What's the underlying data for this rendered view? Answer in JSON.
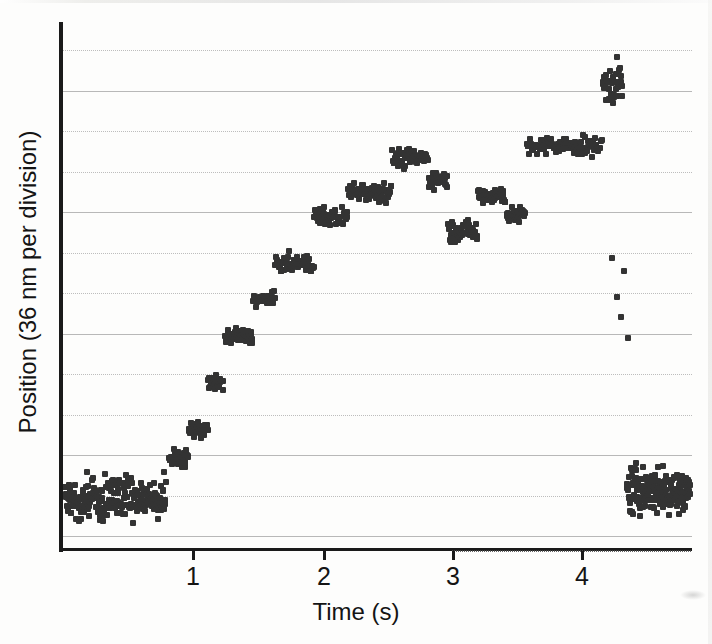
{
  "figure": {
    "title": "",
    "background_color": "#fdfdfc",
    "marker_color": "#333333",
    "axis_color": "#1a1a1a",
    "gridline_color": "#b8b8b8"
  },
  "axes": {
    "x": {
      "label": "Time (s)",
      "ticks": [
        {
          "value": 1,
          "label": "1",
          "px": 192
        },
        {
          "value": 2,
          "label": "2",
          "px": 323
        },
        {
          "value": 3,
          "label": "3",
          "px": 452
        },
        {
          "value": 4,
          "label": "4",
          "px": 581
        }
      ],
      "range": [
        0,
        4.85
      ],
      "origin_px": 62,
      "px_per_unit": 129.7
    },
    "y": {
      "label": "Position (36 nm per division)",
      "division_nm": 36,
      "gridlines_px": [
        50,
        91,
        131,
        172,
        212,
        253,
        293,
        334,
        374,
        415,
        455,
        496,
        536
      ],
      "gridline_styles": [
        "dotted",
        "solid",
        "dotted",
        "dotted",
        "solid",
        "dotted",
        "dotted",
        "solid",
        "dotted",
        "dotted",
        "solid",
        "dotted",
        "solid"
      ],
      "range_px": [
        22,
        550
      ]
    }
  },
  "chart_data": {
    "type": "scatter",
    "title": "",
    "xlabel": "Time (s)",
    "ylabel": "Position (36 nm per division)",
    "xlim": [
      0,
      4.85
    ],
    "ylim": [
      0,
      13
    ],
    "grid": true,
    "legend": null,
    "units": {
      "x": "s",
      "y": "divisions of 36 nm"
    },
    "segments": [
      {
        "name": "baseline-noise-start",
        "t_start": 0.0,
        "t_end": 0.78,
        "level": 1.35,
        "noise": 0.55,
        "n_points": 215
      },
      {
        "name": "step-1",
        "t_start": 0.8,
        "t_end": 0.95,
        "level": 2.35,
        "noise": 0.22,
        "n_points": 32
      },
      {
        "name": "step-2",
        "t_start": 0.95,
        "t_end": 1.1,
        "level": 3.05,
        "noise": 0.2,
        "n_points": 34
      },
      {
        "name": "step-3",
        "t_start": 1.1,
        "t_end": 1.22,
        "level": 4.2,
        "noise": 0.18,
        "n_points": 26
      },
      {
        "name": "step-4",
        "t_start": 1.23,
        "t_end": 1.45,
        "level": 5.35,
        "noise": 0.2,
        "n_points": 40
      },
      {
        "name": "step-5",
        "t_start": 1.45,
        "t_end": 1.62,
        "level": 6.25,
        "noise": 0.18,
        "n_points": 32
      },
      {
        "name": "step-6",
        "t_start": 1.62,
        "t_end": 1.92,
        "level": 7.15,
        "noise": 0.22,
        "n_points": 54
      },
      {
        "name": "step-7",
        "t_start": 1.92,
        "t_end": 2.18,
        "level": 8.3,
        "noise": 0.24,
        "n_points": 50
      },
      {
        "name": "step-8",
        "t_start": 2.18,
        "t_end": 2.52,
        "level": 8.95,
        "noise": 0.26,
        "n_points": 62
      },
      {
        "name": "step-9",
        "t_start": 2.52,
        "t_end": 2.8,
        "level": 9.75,
        "noise": 0.24,
        "n_points": 52
      },
      {
        "name": "step-10",
        "t_start": 2.8,
        "t_end": 2.95,
        "level": 9.25,
        "noise": 0.22,
        "n_points": 30
      },
      {
        "name": "backward-step",
        "t_start": 2.95,
        "t_end": 3.18,
        "level": 7.95,
        "noise": 0.26,
        "n_points": 44
      },
      {
        "name": "step-11",
        "t_start": 3.18,
        "t_end": 3.4,
        "level": 8.85,
        "noise": 0.24,
        "n_points": 42
      },
      {
        "name": "step-12",
        "t_start": 3.4,
        "t_end": 3.55,
        "level": 8.35,
        "noise": 0.2,
        "n_points": 28
      },
      {
        "name": "step-13",
        "t_start": 3.56,
        "t_end": 4.14,
        "level": 10.05,
        "noise": 0.24,
        "n_points": 96
      },
      {
        "name": "fast-rise",
        "t_start": 4.14,
        "t_end": 4.3,
        "level": 11.6,
        "noise": 0.55,
        "n_points": 34
      },
      {
        "name": "detachment-sparse",
        "t_start": 4.21,
        "t_end": 4.35,
        "level": 6.1,
        "noise": 1.7,
        "n_points": 5
      },
      {
        "name": "baseline-noise-end",
        "t_start": 4.33,
        "t_end": 4.82,
        "level": 1.55,
        "noise": 0.62,
        "n_points": 175
      }
    ]
  }
}
